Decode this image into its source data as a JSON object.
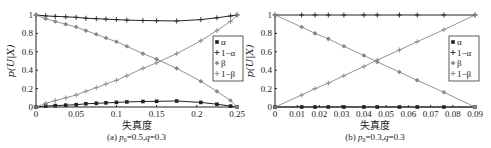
{
  "chart_data": [
    {
      "type": "line",
      "caption": "(a) p0=0.5,q=0.3",
      "caption_parts": {
        "prefix": "(a) ",
        "p": "p",
        "sub": "0",
        "rest": "=0.5,",
        "q": "q",
        "rest2": "=0.3"
      },
      "xlabel": "失真度",
      "ylabel": "p(U|X)",
      "xlim": [
        0,
        0.25
      ],
      "ylim": [
        0,
        1
      ],
      "xticks": [
        "0",
        "0.05",
        "0.1",
        "0.15",
        "0.2",
        "0.25"
      ],
      "yticks": [
        "0",
        "0.2",
        "0.4",
        "0.6",
        "0.8",
        "1"
      ],
      "legend": [
        "α",
        "1−α",
        "β",
        "1−β"
      ],
      "legend_position": "right-center",
      "series": [
        {
          "name": "α",
          "marker": "filled-square",
          "color": "#222222",
          "x": [
            0,
            0.012,
            0.024,
            0.037,
            0.05,
            0.062,
            0.075,
            0.087,
            0.1,
            0.113,
            0.133,
            0.15,
            0.175,
            0.205,
            0.225,
            0.242,
            0.25
          ],
          "y": [
            0,
            0.01,
            0.015,
            0.02,
            0.025,
            0.035,
            0.04,
            0.045,
            0.05,
            0.055,
            0.06,
            0.062,
            0.065,
            0.05,
            0.03,
            0.01,
            0
          ]
        },
        {
          "name": "1−α",
          "marker": "plus",
          "color": "#222222",
          "x": [
            0,
            0.012,
            0.024,
            0.037,
            0.05,
            0.062,
            0.075,
            0.087,
            0.1,
            0.113,
            0.133,
            0.15,
            0.175,
            0.205,
            0.225,
            0.242,
            0.25
          ],
          "y": [
            1,
            0.99,
            0.985,
            0.98,
            0.975,
            0.965,
            0.96,
            0.955,
            0.95,
            0.945,
            0.94,
            0.938,
            0.935,
            0.95,
            0.97,
            0.99,
            1
          ]
        },
        {
          "name": "β",
          "marker": "asterisk",
          "color": "#888888",
          "x": [
            0,
            0.012,
            0.024,
            0.037,
            0.05,
            0.062,
            0.075,
            0.087,
            0.1,
            0.113,
            0.133,
            0.15,
            0.175,
            0.205,
            0.225,
            0.242,
            0.25
          ],
          "y": [
            1,
            0.96,
            0.93,
            0.9,
            0.87,
            0.83,
            0.79,
            0.75,
            0.71,
            0.66,
            0.58,
            0.52,
            0.42,
            0.28,
            0.17,
            0.07,
            0
          ]
        },
        {
          "name": "1−β",
          "marker": "plus-light",
          "color": "#888888",
          "x": [
            0,
            0.012,
            0.024,
            0.037,
            0.05,
            0.062,
            0.075,
            0.087,
            0.1,
            0.113,
            0.133,
            0.15,
            0.175,
            0.205,
            0.225,
            0.242,
            0.25
          ],
          "y": [
            0,
            0.04,
            0.07,
            0.1,
            0.13,
            0.17,
            0.21,
            0.25,
            0.29,
            0.34,
            0.42,
            0.48,
            0.58,
            0.72,
            0.83,
            0.93,
            1
          ]
        }
      ]
    },
    {
      "type": "line",
      "caption": "(b) p0=0.3,q=0.3",
      "caption_parts": {
        "prefix": "(b) ",
        "p": "p",
        "sub": "0",
        "rest": "=0.3,",
        "q": "q",
        "rest2": "=0.3"
      },
      "xlabel": "失真度",
      "ylabel": "p(U|X)",
      "xlim": [
        0,
        0.09
      ],
      "ylim": [
        0,
        1
      ],
      "xticks": [
        "0",
        "0.01",
        "0.02",
        "0.03",
        "0.04",
        "0.05",
        "0.06",
        "0.07",
        "0.08",
        "0.09"
      ],
      "yticks": [
        "0",
        "0.2",
        "0.4",
        "0.6",
        "0.8",
        "1"
      ],
      "legend": [
        "α",
        "1−α",
        "β",
        "1−β"
      ],
      "legend_position": "right-center",
      "series": [
        {
          "name": "α",
          "marker": "filled-square",
          "color": "#222222",
          "x": [
            0,
            0.012,
            0.018,
            0.024,
            0.031,
            0.04,
            0.046,
            0.056,
            0.064,
            0.076,
            0.09
          ],
          "y": [
            0,
            0,
            0,
            0,
            0,
            0,
            0,
            0,
            0,
            0,
            0
          ]
        },
        {
          "name": "1−α",
          "marker": "plus",
          "color": "#222222",
          "x": [
            0,
            0.012,
            0.018,
            0.024,
            0.031,
            0.04,
            0.046,
            0.056,
            0.064,
            0.076,
            0.09
          ],
          "y": [
            1,
            1,
            1,
            1,
            1,
            1,
            1,
            1,
            1,
            1,
            1
          ]
        },
        {
          "name": "β",
          "marker": "asterisk",
          "color": "#888888",
          "x": [
            0,
            0.012,
            0.018,
            0.024,
            0.031,
            0.04,
            0.046,
            0.056,
            0.064,
            0.076,
            0.09
          ],
          "y": [
            1,
            0.87,
            0.8,
            0.74,
            0.66,
            0.56,
            0.49,
            0.38,
            0.29,
            0.16,
            0
          ]
        },
        {
          "name": "1−β",
          "marker": "plus-light",
          "color": "#888888",
          "x": [
            0,
            0.012,
            0.018,
            0.024,
            0.031,
            0.04,
            0.046,
            0.056,
            0.064,
            0.076,
            0.09
          ],
          "y": [
            0,
            0.13,
            0.2,
            0.26,
            0.34,
            0.44,
            0.51,
            0.62,
            0.71,
            0.84,
            1
          ]
        }
      ]
    }
  ]
}
